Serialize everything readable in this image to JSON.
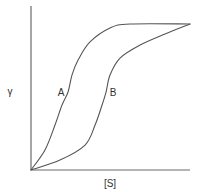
{
  "chart_data": {
    "type": "line",
    "title": "",
    "xlabel": "[S]",
    "ylabel": "γ",
    "xlim": [
      0,
      1
    ],
    "ylim": [
      0,
      1
    ],
    "grid": false,
    "legend": "none",
    "series": [
      {
        "name": "A",
        "label": "A",
        "x": [
          0,
          0.088,
          0.151,
          0.195,
          0.233,
          0.258,
          0.296,
          0.371,
          0.497,
          0.623,
          1.0
        ],
        "y": [
          0,
          0.137,
          0.308,
          0.445,
          0.534,
          0.651,
          0.753,
          0.877,
          0.973,
          1.0,
          1.0
        ]
      },
      {
        "name": "B",
        "label": "B",
        "x": [
          0,
          0.182,
          0.34,
          0.403,
          0.447,
          0.472,
          0.497,
          0.56,
          0.686,
          0.843,
          1.0
        ],
        "y": [
          0,
          0.068,
          0.171,
          0.308,
          0.445,
          0.534,
          0.651,
          0.767,
          0.856,
          0.932,
          1.0
        ]
      }
    ],
    "annotations": [
      {
        "text": "A",
        "series": "A"
      },
      {
        "text": "B",
        "series": "B"
      }
    ]
  }
}
